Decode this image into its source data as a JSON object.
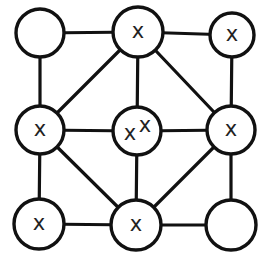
{
  "diagram": {
    "type": "grid-graph",
    "rows": 3,
    "cols": 3,
    "colors": {
      "stroke": "#111111",
      "fill": "#ffffff",
      "text": "#222222"
    },
    "nodes": [
      {
        "id": "r0c0",
        "cx": 40,
        "cy": 33,
        "r": 24,
        "label": ""
      },
      {
        "id": "r0c1",
        "cx": 138,
        "cy": 32,
        "r": 25,
        "label": "x"
      },
      {
        "id": "r0c2",
        "cx": 232,
        "cy": 35,
        "r": 22,
        "label": "x"
      },
      {
        "id": "r1c0",
        "cx": 40,
        "cy": 130,
        "r": 24,
        "label": "x"
      },
      {
        "id": "r1c1",
        "cx": 137,
        "cy": 131,
        "r": 24,
        "label": "x x",
        "label_parts": [
          "x",
          "x"
        ]
      },
      {
        "id": "r1c2",
        "cx": 231,
        "cy": 130,
        "r": 24,
        "label": "x"
      },
      {
        "id": "r2c0",
        "cx": 39,
        "cy": 224,
        "r": 25,
        "label": "x"
      },
      {
        "id": "r2c1",
        "cx": 136,
        "cy": 225,
        "r": 25,
        "label": "x"
      },
      {
        "id": "r2c2",
        "cx": 231,
        "cy": 225,
        "r": 25,
        "label": ""
      }
    ],
    "edges": [
      [
        "r0c0",
        "r0c1"
      ],
      [
        "r0c1",
        "r0c2"
      ],
      [
        "r1c0",
        "r1c1"
      ],
      [
        "r1c1",
        "r1c2"
      ],
      [
        "r2c0",
        "r2c1"
      ],
      [
        "r2c1",
        "r2c2"
      ],
      [
        "r0c0",
        "r1c0"
      ],
      [
        "r1c0",
        "r2c0"
      ],
      [
        "r0c1",
        "r1c1"
      ],
      [
        "r1c1",
        "r2c1"
      ],
      [
        "r0c2",
        "r1c2"
      ],
      [
        "r1c2",
        "r2c2"
      ],
      [
        "r0c1",
        "r1c0"
      ],
      [
        "r0c1",
        "r1c2"
      ],
      [
        "r1c0",
        "r2c1"
      ],
      [
        "r1c2",
        "r2c1"
      ]
    ]
  }
}
